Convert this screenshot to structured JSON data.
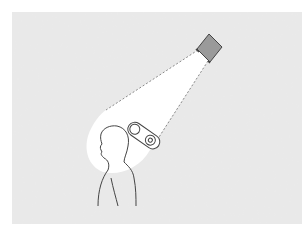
{
  "diagram": {
    "title": "",
    "elements": [
      {
        "id": "background",
        "type": "textured-panel",
        "color": "#e6e6e6"
      },
      {
        "id": "camera",
        "type": "sensor-box",
        "color": "#9a9a9a"
      },
      {
        "id": "light-cone",
        "type": "beam",
        "fill": "#ffffff",
        "edge_style": "dashed"
      },
      {
        "id": "device",
        "type": "head-mounted-device"
      },
      {
        "id": "person",
        "type": "silhouette-outline"
      }
    ],
    "colors": {
      "background": "#e4e4e4",
      "background_speckle": "#d2d2d2",
      "beam": "#ffffff",
      "stroke": "#444444",
      "camera_fill": "#9a9a9a"
    }
  }
}
